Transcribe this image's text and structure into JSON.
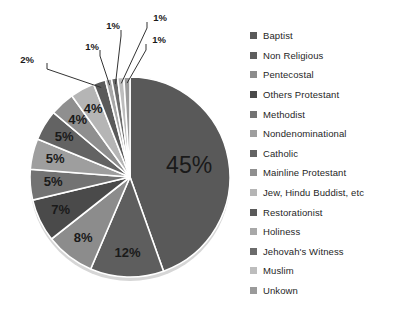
{
  "chart_data": {
    "type": "pie",
    "title": "",
    "legend_position": "right",
    "start_angle_deg": 0,
    "direction": "clockwise",
    "categories": [
      "Baptist",
      "Non Religious",
      "Pentecostal",
      "Others Protestant",
      "Methodist",
      "Nondenominational",
      "Catholic",
      "Mainline Protestant",
      "Jew, Hindu Buddist, etc",
      "Restorationist",
      "Holiness",
      "Jehovah's Witness",
      "Muslim",
      "Unkown"
    ],
    "values": [
      45,
      12,
      8,
      7,
      5,
      5,
      5,
      4,
      4,
      2,
      1,
      1,
      1,
      1
    ],
    "labels": [
      "45%",
      "12%",
      "8%",
      "7%",
      "5%",
      "5%",
      "5%",
      "4%",
      "4%",
      "2%",
      "1%",
      "1%",
      "1%",
      "1%"
    ],
    "colors": [
      "#595959",
      "#5e5e5e",
      "#8c8c8c",
      "#4a4a4a",
      "#737373",
      "#9e9e9e",
      "#636363",
      "#8f8f8f",
      "#b5b5b5",
      "#5a5a5a",
      "#a8a8a8",
      "#6b6b6b",
      "#bdbdbd",
      "#9a9a9a"
    ],
    "slice_border_color": "#ffffff",
    "background": "#ffffff",
    "label_color": "#1a1a1a"
  },
  "legend": {
    "items": [
      {
        "label": "Baptist",
        "color": "#595959"
      },
      {
        "label": "Non Religious",
        "color": "#5e5e5e"
      },
      {
        "label": "Pentecostal",
        "color": "#8c8c8c"
      },
      {
        "label": "Others Protestant",
        "color": "#4a4a4a"
      },
      {
        "label": "Methodist",
        "color": "#737373"
      },
      {
        "label": "Nondenominational",
        "color": "#9e9e9e"
      },
      {
        "label": "Catholic",
        "color": "#636363"
      },
      {
        "label": "Mainline Protestant",
        "color": "#8f8f8f"
      },
      {
        "label": "Jew, Hindu Buddist, etc",
        "color": "#b5b5b5"
      },
      {
        "label": "Restorationist",
        "color": "#5a5a5a"
      },
      {
        "label": "Holiness",
        "color": "#a8a8a8"
      },
      {
        "label": "Jehovah's Witness",
        "color": "#6b6b6b"
      },
      {
        "label": "Muslim",
        "color": "#bdbdbd"
      },
      {
        "label": "Unkown",
        "color": "#9a9a9a"
      }
    ]
  }
}
